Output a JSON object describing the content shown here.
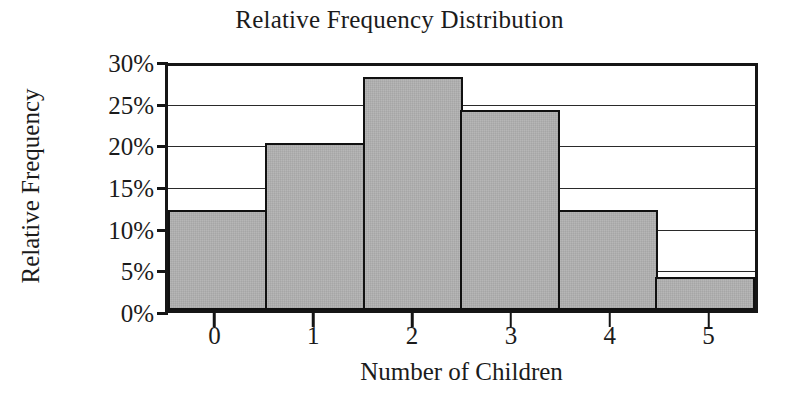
{
  "chart_data": {
    "type": "bar",
    "title": "Relative Frequency Distribution",
    "xlabel": "Number of Children",
    "ylabel": "Relative Frequency",
    "categories": [
      "0",
      "1",
      "2",
      "3",
      "4",
      "5"
    ],
    "values": [
      12,
      20,
      28,
      24,
      12,
      4
    ],
    "value_unit": "%",
    "ylim": [
      0,
      30
    ],
    "ytick_values": [
      0,
      5,
      10,
      15,
      20,
      25,
      30
    ],
    "ytick_labels": [
      "0%",
      "5%",
      "10%",
      "15%",
      "20%",
      "25%",
      "30%"
    ],
    "grid": "horizontal",
    "legend": "none",
    "bar_fill_color": "#b3b3b3",
    "bar_edge_color": "#111111",
    "axis_color": "#151515",
    "background_color": "#ffffff"
  }
}
